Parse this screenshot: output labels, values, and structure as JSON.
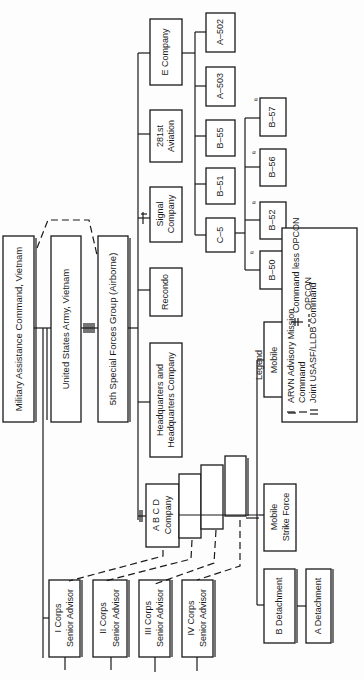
{
  "chart": {
    "orientation": "rotated-90-ccw",
    "nodes": {
      "macv": "Military Assistance Command, Vietnam",
      "usarv": "United States Army, Vietnam",
      "sfg": "5th Special Forces Group (Airborne)",
      "hq": [
        "Headquarters and",
        "Headquarters Company"
      ],
      "recondo": "Recondo",
      "signal": [
        "Signal",
        "Company"
      ],
      "aviation": [
        "281st",
        "Aviation"
      ],
      "ecompany": "E Company",
      "abcd": [
        "A B C D",
        "Company"
      ],
      "c5": "C–5",
      "b51": "B–51",
      "b55": "B–55",
      "a503": "A–503",
      "a502": "A–502",
      "b50": "B–50",
      "b52": "B–52",
      "b56": "B–56",
      "b57": "B–57",
      "msf": [
        "Mobile",
        "Strike Force"
      ],
      "mgf": [
        "Mobile",
        "Guerrilla Force"
      ],
      "bdet": "B Detachment",
      "adet": "A Detachment",
      "corps1": [
        "I Corps",
        "Senior Advisor"
      ],
      "corps2": [
        "II Corps",
        "Senior Advisor"
      ],
      "corps3": [
        "III Corps",
        "Senior Advisor"
      ],
      "corps4": [
        "IV Corps",
        "Senior Advisor"
      ]
    },
    "annotation_mark": "a",
    "legend": {
      "title": "Legend",
      "items": [
        {
          "symbol": "double-line",
          "label": "ARVN Advisory Mission"
        },
        {
          "symbol": "single-line",
          "label": "Command"
        },
        {
          "symbol": "parallel-line",
          "label": "Joint USASF/LLDB Command"
        },
        {
          "symbol": "crossed-line",
          "label": "Command less OPCON"
        },
        {
          "symbol": "dashed-line",
          "label": "OPCON"
        }
      ]
    }
  }
}
